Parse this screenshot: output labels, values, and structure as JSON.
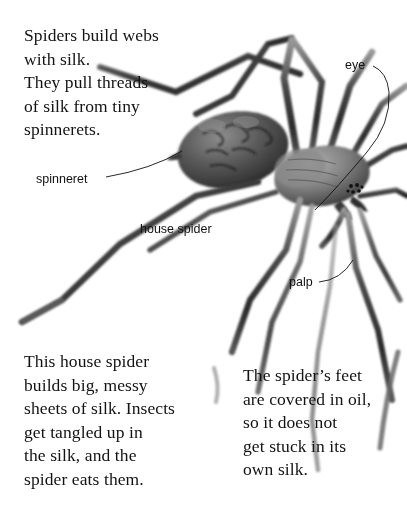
{
  "page": {
    "background_color": "#ffffff",
    "text_color": "#131313",
    "label_color": "#111111"
  },
  "paragraphs": {
    "intro": "Spiders build webs\nwith silk.\nThey pull threads\nof silk from tiny\nspinnerets.",
    "web": "This house spider\nbuilds big, messy\nsheets of silk. Insects\nget tangled up in\nthe silk, and the\nspider eats them.",
    "feet": "The spider’s feet\nare covered in oil,\nso it does not\nget stuck in its\nown silk."
  },
  "callouts": {
    "eye": "eye",
    "spinneret": "spinneret",
    "house_spider": "house spider",
    "palp": "palp"
  },
  "figure": {
    "name": "house-spider-photo",
    "leader_line_color": "#111111",
    "body_tone_dark": "#2e2e2e",
    "body_tone_mid": "#6b6b6b",
    "body_tone_light": "#a9a9a9"
  }
}
